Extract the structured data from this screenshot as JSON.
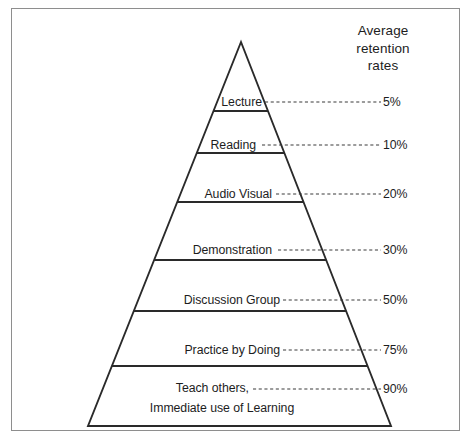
{
  "chart_data": {
    "type": "pyramid",
    "legend_title_lines": [
      "Average",
      "retention",
      "rates"
    ],
    "categories": [
      "Lecture",
      "Reading",
      "Audio Visual",
      "Demonstration",
      "Discussion Group",
      "Practice by Doing",
      "Teach others, Immediate use of Learning"
    ],
    "values": [
      5,
      10,
      20,
      30,
      50,
      75,
      90
    ],
    "value_labels": [
      "5%",
      "10%",
      "20%",
      "30%",
      "50%",
      "75%",
      "90%"
    ],
    "ylabel": "Average retention rates",
    "xlabel": "",
    "grid": false,
    "legend_position": "top-right",
    "tiers": [
      {
        "label": "Lecture",
        "value": 5,
        "value_label": "5%",
        "label_x": 262,
        "label_y": 102,
        "pct_x": 383,
        "pct_y": 102,
        "leader_start_x": 265,
        "leader_end_x": 381,
        "align": "right"
      },
      {
        "label": "Reading",
        "value": 10,
        "value_label": "10%",
        "label_x": 256,
        "label_y": 145,
        "pct_x": 383,
        "pct_y": 145,
        "leader_start_x": 262,
        "leader_end_x": 381,
        "align": "right"
      },
      {
        "label": "Audio Visual",
        "value": 20,
        "value_label": "20%",
        "label_x": 272,
        "label_y": 194,
        "pct_x": 383,
        "pct_y": 194,
        "leader_start_x": 276,
        "leader_end_x": 381,
        "align": "right"
      },
      {
        "label": "Demonstration",
        "value": 30,
        "value_label": "30%",
        "label_x": 272,
        "label_y": 250,
        "pct_x": 383,
        "pct_y": 250,
        "leader_start_x": 278,
        "leader_end_x": 381,
        "align": "right"
      },
      {
        "label": "Discussion Group",
        "value": 50,
        "value_label": "50%",
        "label_x": 280,
        "label_y": 300,
        "pct_x": 383,
        "pct_y": 300,
        "leader_start_x": 283,
        "leader_end_x": 381,
        "align": "right"
      },
      {
        "label": "Practice by Doing",
        "value": 75,
        "value_label": "75%",
        "label_x": 280,
        "label_y": 350,
        "pct_x": 383,
        "pct_y": 350,
        "leader_start_x": 283,
        "leader_end_x": 381,
        "align": "right"
      },
      {
        "label": "Teach others,",
        "label2": "Immediate use of Learning",
        "value": 90,
        "value_label": "90%",
        "label_x": 249,
        "label_y": 388,
        "label2_x": 222,
        "label2_y": 408,
        "pct_x": 383,
        "pct_y": 389,
        "leader_start_x": 253,
        "leader_end_x": 381,
        "align": "right"
      }
    ],
    "geometry": {
      "apex_x": 241,
      "apex_y": 42,
      "base_left_x": 88,
      "base_right_x": 391,
      "base_y": 426,
      "divider_y": [
        111,
        153,
        202,
        260,
        311,
        366
      ]
    },
    "colors": {
      "line": "#2a2a2a",
      "leader": "#3a3a3a",
      "frame": "#8e8e8e",
      "text": "#1d1d1d",
      "background": "#ffffff"
    }
  }
}
